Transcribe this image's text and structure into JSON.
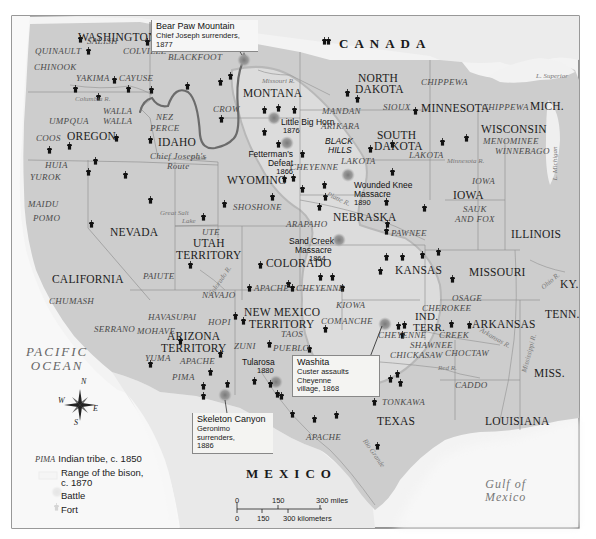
{
  "map": {
    "title_regions": {
      "countries": [
        "CANADA",
        "MEXICO"
      ],
      "water": {
        "ocean": "PACIFIC\nOCEAN",
        "ocean_line1": "PACIFIC",
        "ocean_line2": "OCEAN",
        "gulf_line1": "Gulf of",
        "gulf_line2": "Mexico"
      }
    },
    "states": [
      {
        "name": "WASHINGTON",
        "x": 78,
        "y": 38
      },
      {
        "name": "OREGON",
        "x": 67,
        "y": 130
      },
      {
        "name": "IDAHO",
        "x": 157,
        "y": 137
      },
      {
        "name": "MONTANA",
        "x": 242,
        "y": 92
      },
      {
        "name": "WYOMING",
        "x": 228,
        "y": 175
      },
      {
        "name": "NEVADA",
        "x": 110,
        "y": 227
      },
      {
        "name": "CALIFORNIA",
        "x": 52,
        "y": 277
      },
      {
        "name": "UTAH",
        "x": 195,
        "y": 238
      },
      {
        "name": "TERRITORY",
        "x": 176,
        "y": 250
      },
      {
        "name": "COLORADO",
        "x": 266,
        "y": 258
      },
      {
        "name": "NORTH",
        "x": 358,
        "y": 73
      },
      {
        "name": "DAKOTA",
        "x": 355,
        "y": 85
      },
      {
        "name": "SOUTH",
        "x": 377,
        "y": 130
      },
      {
        "name": "DAKOTA",
        "x": 374,
        "y": 142
      },
      {
        "name": "NEBRASKA",
        "x": 333,
        "y": 212
      },
      {
        "name": "KANSAS",
        "x": 395,
        "y": 265
      },
      {
        "name": "MINNESOTA",
        "x": 422,
        "y": 103
      },
      {
        "name": "WISCONSIN",
        "x": 481,
        "y": 125
      },
      {
        "name": "MICH.",
        "x": 530,
        "y": 100
      },
      {
        "name": "IOWA",
        "x": 453,
        "y": 188
      },
      {
        "name": "ILLINOIS",
        "x": 511,
        "y": 228
      },
      {
        "name": "MISSOURI",
        "x": 469,
        "y": 265
      },
      {
        "name": "KY.",
        "x": 560,
        "y": 277
      },
      {
        "name": "TENN.",
        "x": 545,
        "y": 307
      },
      {
        "name": "ARKANSAS",
        "x": 472,
        "y": 317
      },
      {
        "name": "MISS.",
        "x": 534,
        "y": 368
      },
      {
        "name": "LOUISIANA",
        "x": 485,
        "y": 415
      },
      {
        "name": "TEXAS",
        "x": 377,
        "y": 415
      },
      {
        "name": "NEW MEXICO",
        "x": 243,
        "y": 307
      },
      {
        "name": "TERRITORY",
        "x": 248,
        "y": 319
      },
      {
        "name": "ARIZONA",
        "x": 167,
        "y": 333
      },
      {
        "name": "TERRITORY",
        "x": 161,
        "y": 345
      },
      {
        "name": "IND.",
        "x": 415,
        "y": 311
      },
      {
        "name": "TERR.",
        "x": 413,
        "y": 322
      }
    ],
    "tribes": [
      {
        "name": "SALISH",
        "x": 87,
        "y": 38
      },
      {
        "name": "QUINAULT",
        "x": 35,
        "y": 47
      },
      {
        "name": "COLVILLE",
        "x": 123,
        "y": 47
      },
      {
        "name": "BLACKFOOT",
        "x": 168,
        "y": 52
      },
      {
        "name": "CHINOOK",
        "x": 34,
        "y": 64
      },
      {
        "name": "YAKIMA",
        "x": 76,
        "y": 75
      },
      {
        "name": "CAYUSE",
        "x": 120,
        "y": 75
      },
      {
        "name": "WALLA",
        "x": 103,
        "y": 108
      },
      {
        "name": "WALLA",
        "x": 103,
        "y": 118
      },
      {
        "name": "UMPQUA",
        "x": 49,
        "y": 117
      },
      {
        "name": "NEZ",
        "x": 156,
        "y": 114
      },
      {
        "name": "PERCE",
        "x": 150,
        "y": 124
      },
      {
        "name": "CROW",
        "x": 213,
        "y": 105
      },
      {
        "name": "COOS",
        "x": 36,
        "y": 135
      },
      {
        "name": "HUIA",
        "x": 45,
        "y": 162
      },
      {
        "name": "YUROK",
        "x": 30,
        "y": 175
      },
      {
        "name": "MAIDU",
        "x": 28,
        "y": 200
      },
      {
        "name": "POMO",
        "x": 33,
        "y": 215
      },
      {
        "name": "SHOSHONE",
        "x": 233,
        "y": 202
      },
      {
        "name": "CHEYENNE",
        "x": 290,
        "y": 163
      },
      {
        "name": "MANDAN",
        "x": 322,
        "y": 107
      },
      {
        "name": "ARIKARA",
        "x": 321,
        "y": 122
      },
      {
        "name": "LAKOTA",
        "x": 341,
        "y": 157
      },
      {
        "name": "LAKOTA",
        "x": 409,
        "y": 151
      },
      {
        "name": "SIOUX",
        "x": 383,
        "y": 103
      },
      {
        "name": "CHIPPEWA",
        "x": 421,
        "y": 78
      },
      {
        "name": "CHIPPEWA",
        "x": 482,
        "y": 103
      },
      {
        "name": "MENOMINEE",
        "x": 483,
        "y": 137
      },
      {
        "name": "WINNEBAGO",
        "x": 495,
        "y": 147
      },
      {
        "name": "IOWA",
        "x": 472,
        "y": 177
      },
      {
        "name": "SAUK",
        "x": 463,
        "y": 205
      },
      {
        "name": "AND FOX",
        "x": 455,
        "y": 215
      },
      {
        "name": "PAWNEE",
        "x": 391,
        "y": 231
      },
      {
        "name": "ARAPAHO",
        "x": 286,
        "y": 221
      },
      {
        "name": "UTE",
        "x": 202,
        "y": 228
      },
      {
        "name": "PAIUTE",
        "x": 143,
        "y": 273
      },
      {
        "name": "CHUMASH",
        "x": 49,
        "y": 297
      },
      {
        "name": "NAVAJO",
        "x": 202,
        "y": 291
      },
      {
        "name": "APACHE",
        "x": 254,
        "y": 284
      },
      {
        "name": "CHEYENNE",
        "x": 296,
        "y": 284
      },
      {
        "name": "KIOWA",
        "x": 336,
        "y": 302
      },
      {
        "name": "COMANCHE",
        "x": 321,
        "y": 318
      },
      {
        "name": "HAVASUPAI",
        "x": 148,
        "y": 313
      },
      {
        "name": "HOPI",
        "x": 208,
        "y": 318
      },
      {
        "name": "SERRANO",
        "x": 94,
        "y": 325
      },
      {
        "name": "MOHAVE",
        "x": 137,
        "y": 327
      },
      {
        "name": "ZUNI",
        "x": 234,
        "y": 343
      },
      {
        "name": "TAOS",
        "x": 281,
        "y": 331
      },
      {
        "name": "PUEBLO",
        "x": 273,
        "y": 345
      },
      {
        "name": "YUMA",
        "x": 145,
        "y": 355
      },
      {
        "name": "APACHE",
        "x": 180,
        "y": 358
      },
      {
        "name": "PIMA",
        "x": 172,
        "y": 374
      },
      {
        "name": "OSAGE",
        "x": 452,
        "y": 295
      },
      {
        "name": "CHEROKEE",
        "x": 420,
        "y": 305
      },
      {
        "name": "CHEYENNE",
        "x": 378,
        "y": 332
      },
      {
        "name": "CREEK",
        "x": 439,
        "y": 332
      },
      {
        "name": "SHAWNEE",
        "x": 410,
        "y": 342
      },
      {
        "name": "CHICKASAW",
        "x": 390,
        "y": 352
      },
      {
        "name": "CHOCTAW",
        "x": 445,
        "y": 350
      },
      {
        "name": "CADDO",
        "x": 455,
        "y": 383
      },
      {
        "name": "TONKAWA",
        "x": 382,
        "y": 398
      },
      {
        "name": "APACHE",
        "x": 306,
        "y": 434
      }
    ],
    "rivers": [
      {
        "name": "Missouri R.",
        "x": 262,
        "y": 80
      },
      {
        "name": "Columbia R.",
        "x": 75,
        "y": 97
      },
      {
        "name": "Snake",
        "x": 190,
        "y": 156
      },
      {
        "name": "Great Salt",
        "x": 160,
        "y": 212
      },
      {
        "name": "Lake",
        "x": 182,
        "y": 220
      },
      {
        "name": "Platte R.",
        "x": 326,
        "y": 196
      },
      {
        "name": "Minnesota R.",
        "x": 447,
        "y": 158
      },
      {
        "name": "L. Superior",
        "x": 546,
        "y": 73
      },
      {
        "name": "L. Michigan",
        "x": 553,
        "y": 155
      },
      {
        "name": "Ohio R.",
        "x": 543,
        "y": 280
      },
      {
        "name": "Arkansas R.",
        "x": 478,
        "y": 335
      },
      {
        "name": "Red R.",
        "x": 438,
        "y": 366
      },
      {
        "name": "Mississippi R.",
        "x": 526,
        "y": 343
      },
      {
        "name": "Rio Grande",
        "x": 365,
        "y": 445
      },
      {
        "name": "Colorado R.",
        "x": 213,
        "y": 280
      }
    ],
    "battles": [
      {
        "name": "Little Big Horn",
        "year": "1876",
        "x": 280,
        "y": 118
      },
      {
        "name": "Fetterman's Defeat",
        "year": "1866",
        "x": 243,
        "y": 140
      },
      {
        "name": "Wounded Knee Massacre",
        "name_line1": "Wounded Knee",
        "name_line2": "Massacre",
        "year": "1890",
        "x": 354,
        "y": 177
      },
      {
        "name": "Sand Creek Massacre",
        "name_line1": "Sand Creek",
        "name_line2": "Massacre",
        "year": "1864",
        "x": 289,
        "y": 238
      },
      {
        "name": "Tularosa",
        "year": "1880",
        "x": 242,
        "y": 358
      },
      {
        "name": "BLACK HILLS",
        "line1": "BLACK",
        "line2": "HILLS",
        "x": 325,
        "y": 136
      }
    ],
    "callouts": {
      "bear_paw": {
        "title": "Bear Paw Mountain",
        "detail": "Chief Joseph surrenders, 1877"
      },
      "washita": {
        "title": "Washita",
        "detail_line1": "Custer assaults Cheyenne",
        "detail_line2": "village, 1868"
      },
      "skeleton": {
        "title": "Skeleton Canyon",
        "detail_line1": "Geronimo surrenders,",
        "detail_line2": "1886"
      }
    },
    "route_label": {
      "line1": "Chief Joseph's",
      "line2": "Route"
    },
    "compass": {
      "n": "N",
      "s": "S",
      "e": "E",
      "w": "W"
    },
    "legend": {
      "tribe_sample": "PIMA",
      "tribe_label": "Indian tribe, c. 1850",
      "bison_label_line1": "Range of the bison,",
      "bison_label_line2": "c. 1870",
      "battle_label": "Battle",
      "fort_label": "Fort"
    },
    "scale": {
      "miles": [
        "0",
        "150",
        "300 miles"
      ],
      "km": [
        "0",
        "150",
        "300 kilometers"
      ]
    },
    "colors": {
      "us_land": "#c9c9c9",
      "foreign_land": "#ececec",
      "water": "#f6f6f6",
      "bison_range": "#dcdcdc",
      "route": "#6b6b6b",
      "frame": "#555555"
    }
  }
}
